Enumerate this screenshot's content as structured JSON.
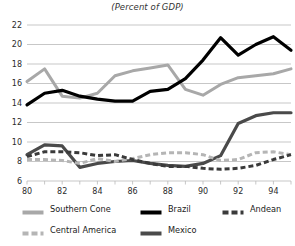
{
  "chart_data": {
    "type": "line",
    "title": "(Percent of GDP)",
    "xlabel": "",
    "ylabel": "",
    "xlim": [
      80,
      95
    ],
    "ylim": [
      6,
      22
    ],
    "yticks": [
      6,
      8,
      10,
      12,
      14,
      16,
      18,
      20,
      22
    ],
    "xticks": [
      80,
      81,
      82,
      83,
      84,
      85,
      86,
      87,
      88,
      89,
      90,
      91,
      92,
      93,
      94,
      95
    ],
    "xticklabels": [
      "80",
      "",
      "82",
      "",
      "84",
      "",
      "86",
      "",
      "88",
      "",
      "90",
      "",
      "92",
      "",
      "94",
      ""
    ],
    "grid": "horizontal",
    "legend_position": "bottom",
    "x": [
      80,
      81,
      82,
      83,
      84,
      85,
      86,
      87,
      88,
      89,
      90,
      91,
      92,
      93,
      94,
      95
    ],
    "series": [
      {
        "name": "Southern Cone",
        "color": "#a8a8a8",
        "style": "solid",
        "width": 3.0,
        "values": [
          16.2,
          17.5,
          14.7,
          14.5,
          15.0,
          16.8,
          17.3,
          17.6,
          17.9,
          15.4,
          14.8,
          15.9,
          16.6,
          16.8,
          17.0,
          17.5
        ]
      },
      {
        "name": "Brazil",
        "color": "#000000",
        "style": "solid",
        "width": 3.2,
        "values": [
          13.8,
          15.0,
          15.3,
          14.7,
          14.4,
          14.2,
          14.2,
          15.2,
          15.4,
          16.5,
          18.4,
          20.7,
          18.9,
          20.0,
          20.8,
          19.4
        ]
      },
      {
        "name": "Andean",
        "color": "#3a3a3a",
        "style": "dashed",
        "width": 3.0,
        "values": [
          8.5,
          9.0,
          9.0,
          8.9,
          8.6,
          8.7,
          8.2,
          7.8,
          7.5,
          7.5,
          7.3,
          7.2,
          7.3,
          7.6,
          8.2,
          8.7
        ]
      },
      {
        "name": "Central America",
        "color": "#b5b5b5",
        "style": "dashed",
        "width": 3.0,
        "values": [
          8.2,
          8.2,
          8.1,
          7.8,
          8.3,
          8.0,
          8.3,
          8.7,
          8.9,
          8.9,
          8.7,
          8.1,
          8.2,
          8.9,
          9.0,
          8.7
        ]
      },
      {
        "name": "Mexico",
        "color": "#4a4a4a",
        "style": "solid",
        "width": 3.2,
        "values": [
          8.7,
          9.7,
          9.6,
          7.4,
          7.8,
          8.0,
          8.1,
          7.8,
          7.6,
          7.5,
          7.8,
          8.6,
          11.9,
          12.7,
          13.0,
          13.0
        ]
      }
    ]
  },
  "legend": {
    "rows": [
      [
        {
          "label": "Southern Cone",
          "color": "#a8a8a8",
          "style": "solid",
          "icon": "line-swatch-icon"
        },
        {
          "label": "Brazil",
          "color": "#000000",
          "style": "solid",
          "icon": "line-swatch-icon"
        },
        {
          "label": "Andean",
          "color": "#3a3a3a",
          "style": "dashed",
          "icon": "dashed-line-swatch-icon"
        }
      ],
      [
        {
          "label": "Central America",
          "color": "#b5b5b5",
          "style": "dashed",
          "icon": "dashed-line-swatch-icon"
        },
        {
          "label": "Mexico",
          "color": "#4a4a4a",
          "style": "solid",
          "icon": "line-swatch-icon"
        }
      ]
    ]
  },
  "axis": {
    "gridline_color": "#b9b9b9",
    "tick_label_color": "#2b2b2b"
  }
}
